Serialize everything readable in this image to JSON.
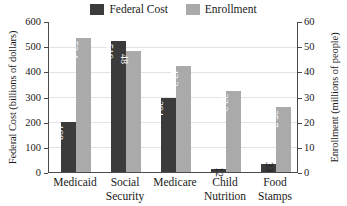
{
  "chart_data": {
    "type": "bar",
    "title": "",
    "categories": [
      "Medicaid",
      "Social Security",
      "Medicare",
      "Child Nutrition",
      "Food Stamps"
    ],
    "category_lines": [
      [
        "Medicaid"
      ],
      [
        "Social",
        "Security"
      ],
      [
        "Medicare"
      ],
      [
        "Child",
        "Nutrition"
      ],
      [
        "Food",
        "Stamps"
      ]
    ],
    "series": [
      {
        "name": "Federal Cost",
        "axis": "left",
        "color": "#3b3b3b",
        "values": [
          198,
          519,
          294,
          12,
          33
        ],
        "labels": [
          "198",
          "519",
          "294",
          "12",
          "33"
        ],
        "label_placement": [
          "inside",
          "inside",
          "inside",
          "outside",
          "outside"
        ]
      },
      {
        "name": "Enrollment",
        "axis": "right",
        "color": "#aaaaaa",
        "values": [
          53.4,
          48,
          42.3,
          32.3,
          25.7
        ],
        "labels": [
          "53.4",
          "48",
          "42.3",
          "32.3",
          "25.7"
        ],
        "label_placement": [
          "inside",
          "inside",
          "inside",
          "inside",
          "inside"
        ]
      }
    ],
    "left_axis": {
      "label": "Federal Cost (billions of dollars)",
      "ticks": [
        0,
        100,
        200,
        300,
        400,
        500,
        600
      ],
      "tick_labels": [
        "0",
        "100",
        "200",
        "300",
        "400",
        "500",
        "600"
      ],
      "min": 0,
      "max": 600
    },
    "right_axis": {
      "label": "Enrollment (millions of people)",
      "ticks": [
        0,
        10,
        20,
        30,
        40,
        50,
        60
      ],
      "tick_labels": [
        "0",
        "10",
        "20",
        "30",
        "40",
        "50",
        "60"
      ],
      "min": 0,
      "max": 60
    },
    "xlabel": "",
    "grid": true,
    "legend_position": "top-center"
  },
  "legend": {
    "entries": [
      {
        "label": "Federal Cost",
        "color": "#3b3b3b"
      },
      {
        "label": "Enrollment",
        "color": "#aaaaaa"
      }
    ]
  }
}
